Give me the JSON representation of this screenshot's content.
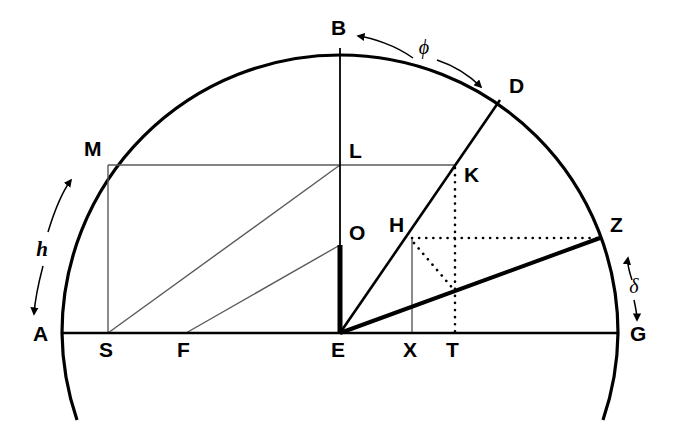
{
  "figure": {
    "kind": "geometric-construction",
    "background_color": "#ffffff",
    "ink_color": "#000000",
    "thin_color": "#555555",
    "width": 677,
    "height": 433
  },
  "points": [
    {
      "id": "A",
      "label": "A",
      "x": 78,
      "y": 333,
      "label_x": 33,
      "label_y": 341
    },
    {
      "id": "B",
      "label": "B",
      "x": 340,
      "y": 48,
      "label_x": 331,
      "label_y": 35
    },
    {
      "id": "D",
      "label": "D",
      "x": 500,
      "y": 100,
      "label_x": 509,
      "label_y": 93
    },
    {
      "id": "E",
      "label": "E",
      "x": 340,
      "y": 333,
      "label_x": 331,
      "label_y": 357
    },
    {
      "id": "F",
      "label": "F",
      "x": 186,
      "y": 333,
      "label_x": 177,
      "label_y": 357
    },
    {
      "id": "G",
      "label": "G",
      "x": 615,
      "y": 333,
      "label_x": 630,
      "label_y": 341
    },
    {
      "id": "H",
      "label": "H",
      "x": 412,
      "y": 238,
      "label_x": 391,
      "label_y": 232
    },
    {
      "id": "K",
      "label": "K",
      "x": 455,
      "y": 165,
      "label_x": 465,
      "label_y": 180
    },
    {
      "id": "L",
      "label": "L",
      "x": 340,
      "y": 165,
      "label_x": 349,
      "label_y": 157
    },
    {
      "id": "M",
      "label": "M",
      "x": 108,
      "y": 165,
      "label_x": 86,
      "label_y": 156
    },
    {
      "id": "O",
      "label": "O",
      "x": 340,
      "y": 245,
      "label_x": 349,
      "label_y": 238
    },
    {
      "id": "S",
      "label": "S",
      "x": 108,
      "y": 333,
      "label_x": 99,
      "label_y": 357
    },
    {
      "id": "T",
      "label": "T",
      "x": 455,
      "y": 333,
      "label_x": 447,
      "label_y": 357
    },
    {
      "id": "X",
      "label": "X",
      "x": 412,
      "y": 333,
      "label_x": 403,
      "label_y": 357
    },
    {
      "id": "Z",
      "label": "Z",
      "x": 600,
      "y": 238,
      "label_x": 611,
      "label_y": 232
    }
  ],
  "annotations": [
    {
      "id": "phi",
      "label": "ϕ",
      "label_x": 424,
      "label_y": 54,
      "meaning": "angle-phi-arc-B-to-D"
    },
    {
      "id": "delta",
      "label": "δ",
      "label_x": 634,
      "label_y": 292,
      "meaning": "angle-delta-arc-Z-to-G"
    },
    {
      "id": "h",
      "label": "h",
      "label_x": 42,
      "label_y": 249,
      "meaning": "altitude-h-arc-A-to-M"
    }
  ],
  "circle": {
    "center_x": 340,
    "center_y": 333,
    "radius": 278,
    "description": "main circle, upper half plus small arcs below baseline at A and G"
  },
  "segments": [
    {
      "id": "baseline-AG",
      "name": "horizontal-diameter-A-G",
      "weight": "medium"
    },
    {
      "id": "vertical-BE",
      "name": "vertical-radius-B-E",
      "weight": "thin"
    },
    {
      "id": "thick-OE",
      "name": "thick-segment-O-E",
      "weight": "thick"
    },
    {
      "id": "ray-ED",
      "name": "ray-E-through-K-to-D",
      "weight": "medium"
    },
    {
      "id": "ray-EZ",
      "name": "ray-E-to-Z",
      "weight": "thick"
    },
    {
      "id": "line-ML",
      "name": "horizontal-M-to-L-to-K",
      "weight": "thin"
    },
    {
      "id": "line-MS",
      "name": "vertical-M-to-S",
      "weight": "thin"
    },
    {
      "id": "line-SL",
      "name": "diagonal-S-to-L",
      "weight": "thin"
    },
    {
      "id": "line-FO",
      "name": "diagonal-F-to-O",
      "weight": "thin"
    },
    {
      "id": "line-HX",
      "name": "vertical-H-to-X",
      "weight": "thin"
    },
    {
      "id": "dotted-HZ",
      "name": "dotted-horizontal-H-to-Z",
      "weight": "dotted"
    },
    {
      "id": "dotted-KT",
      "name": "dotted-vertical-K-to-T",
      "weight": "dotted"
    },
    {
      "id": "dotted-HT",
      "name": "dotted-diagonal-H-to-EZ",
      "weight": "dotted"
    }
  ]
}
